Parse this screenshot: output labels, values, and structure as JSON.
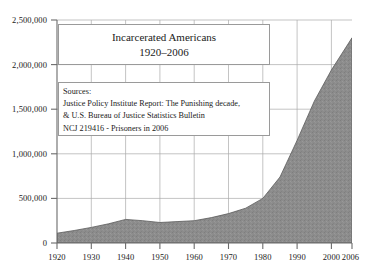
{
  "chart_data": {
    "type": "area",
    "title": "Incarcerated Americans 1920–2006",
    "title_line1": "Incarcerated Americans",
    "title_line2": "1920–2006",
    "xlabel": "",
    "ylabel": "",
    "xlim": [
      1920,
      2006
    ],
    "ylim": [
      0,
      2500000
    ],
    "grid": true,
    "legend": "none",
    "fill_color": "#8c8c8c",
    "line_color": "#4d4d4d",
    "grid_color": "#aaaaaa",
    "axis_color": "#6b6b6b",
    "x": [
      1920,
      1925,
      1930,
      1935,
      1940,
      1945,
      1950,
      1955,
      1960,
      1965,
      1970,
      1975,
      1980,
      1985,
      1990,
      1995,
      2000,
      2006
    ],
    "values": [
      110000,
      140000,
      175000,
      215000,
      265000,
      250000,
      230000,
      240000,
      250000,
      285000,
      330000,
      390000,
      500000,
      740000,
      1150000,
      1590000,
      1940000,
      2300000
    ],
    "xticks": [
      1920,
      1930,
      1940,
      1950,
      1960,
      1970,
      1980,
      1990,
      2000,
      2006
    ],
    "xtick_labels": [
      "1920",
      "1930",
      "1940",
      "1950",
      "1960",
      "1970",
      "1980",
      "1990",
      "2000",
      "2006"
    ],
    "yticks": [
      0,
      500000,
      1000000,
      1500000,
      2000000,
      2500000
    ],
    "ytick_labels": [
      "0",
      "500,000",
      "1,000,000",
      "1,500,000",
      "2,000,000",
      "2,500,000"
    ]
  },
  "annotations": {
    "title_box": {
      "line1": "Incarcerated Americans",
      "line2": "1920–2006"
    },
    "sources_box": {
      "line1": "Sources:",
      "line2": "Justice Policy Institute Report: The Punishing decade,",
      "line3": "& U.S. Bureau of Justice Statistics Bulletin",
      "line4": "NCJ 219416 - Prisoners in 2006"
    }
  }
}
